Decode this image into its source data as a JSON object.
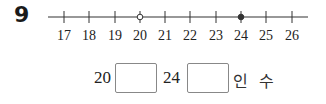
{
  "question": {
    "number": "9"
  },
  "number_line": {
    "ticks": [
      "17",
      "18",
      "19",
      "20",
      "21",
      "22",
      "23",
      "24",
      "25",
      "26"
    ],
    "open_point": "20",
    "closed_point": "24",
    "line_color": "#333333"
  },
  "answer": {
    "left_value": "20",
    "box1_value": "",
    "right_value": "24",
    "box2_value": "",
    "suffix": "인 수"
  }
}
